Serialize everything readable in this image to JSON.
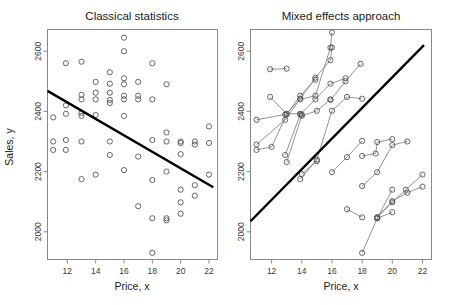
{
  "figure": {
    "width": 452,
    "height": 305,
    "background": "#ffffff",
    "panels": [
      {
        "id": "classical",
        "title": "Classical statistics"
      },
      {
        "id": "mixed",
        "title": "Mixed effects approach"
      }
    ]
  },
  "axes": {
    "xlabel": "Price, x",
    "ylabel": "Sales, y",
    "xticks": [
      12,
      14,
      16,
      18,
      20,
      22
    ],
    "yticks": [
      2000,
      2200,
      2400,
      2600
    ],
    "xlim": [
      10.6,
      22.6
    ],
    "ylim": [
      1908,
      2672
    ]
  },
  "colors": {
    "point_stroke": "#555555",
    "fit_line": "#000000",
    "group_line": "#777777",
    "frame": "#888888",
    "text": "#1a1a1a"
  },
  "chart_data": {
    "type": "scatter",
    "xlabel": "Price, x",
    "ylabel": "Sales, y",
    "xlim": [
      10.6,
      22.6
    ],
    "ylim": [
      1908,
      2672
    ],
    "grid": false,
    "legend": null,
    "panels": [
      {
        "name": "Classical statistics",
        "type": "scatter",
        "marker": "open-circle",
        "points": [
          [
            11.0,
            2380
          ],
          [
            11.0,
            2300
          ],
          [
            11.0,
            2272
          ],
          [
            11.9,
            2560
          ],
          [
            11.9,
            2420
          ],
          [
            11.9,
            2392
          ],
          [
            11.9,
            2305
          ],
          [
            11.9,
            2272
          ],
          [
            13.0,
            2565
          ],
          [
            13.0,
            2455
          ],
          [
            13.0,
            2440
          ],
          [
            13.0,
            2395
          ],
          [
            13.0,
            2385
          ],
          [
            13.0,
            2300
          ],
          [
            13.0,
            2175
          ],
          [
            14.0,
            2498
          ],
          [
            14.0,
            2462
          ],
          [
            14.0,
            2440
          ],
          [
            14.0,
            2388
          ],
          [
            14.0,
            2190
          ],
          [
            15.0,
            2530
          ],
          [
            15.0,
            2492
          ],
          [
            15.0,
            2462
          ],
          [
            15.0,
            2438
          ],
          [
            15.0,
            2428
          ],
          [
            15.0,
            2300
          ],
          [
            15.0,
            2255
          ],
          [
            16.0,
            2645
          ],
          [
            16.0,
            2600
          ],
          [
            16.0,
            2510
          ],
          [
            16.0,
            2490
          ],
          [
            16.0,
            2452
          ],
          [
            16.0,
            2440
          ],
          [
            16.0,
            2385
          ],
          [
            16.0,
            2205
          ],
          [
            17.0,
            2498
          ],
          [
            17.0,
            2452
          ],
          [
            17.0,
            2440
          ],
          [
            17.0,
            2250
          ],
          [
            17.0,
            2085
          ],
          [
            18.0,
            2560
          ],
          [
            18.0,
            2440
          ],
          [
            18.0,
            2305
          ],
          [
            18.0,
            2172
          ],
          [
            18.0,
            2045
          ],
          [
            18.0,
            1930
          ],
          [
            19.0,
            2490
          ],
          [
            19.0,
            2330
          ],
          [
            19.0,
            2300
          ],
          [
            19.0,
            2200
          ],
          [
            19.0,
            2045
          ],
          [
            19.0,
            2038
          ],
          [
            20.0,
            2300
          ],
          [
            20.0,
            2295
          ],
          [
            20.0,
            2258
          ],
          [
            20.0,
            2140
          ],
          [
            20.0,
            2098
          ],
          [
            20.0,
            2060
          ],
          [
            21.0,
            2300
          ],
          [
            21.0,
            2290
          ],
          [
            21.0,
            2155
          ],
          [
            21.0,
            2120
          ],
          [
            22.0,
            2350
          ],
          [
            22.0,
            2295
          ],
          [
            22.0,
            2190
          ]
        ],
        "fit_line": {
          "x": [
            10.6,
            22.3
          ],
          "y": [
            2468,
            2148
          ],
          "label": "pooled regression",
          "slope_sign": "negative"
        }
      },
      {
        "name": "Mixed effects approach",
        "type": "scatter-with-group-lines",
        "marker": "open-circle",
        "groups": [
          {
            "id": "g1",
            "points": [
              [
                11.9,
                2540
              ],
              [
                13.0,
                2542
              ]
            ]
          },
          {
            "id": "g2",
            "points": [
              [
                11.9,
                2448
              ],
              [
                13.0,
                2392
              ],
              [
                13.9,
                2392
              ],
              [
                14.0,
                2390
              ]
            ]
          },
          {
            "id": "g3",
            "points": [
              [
                11.0,
                2372
              ],
              [
                12.9,
                2390
              ],
              [
                13.9,
                2440
              ],
              [
                14.9,
                2452
              ],
              [
                15.9,
                2612
              ],
              [
                16.0,
                2662
              ]
            ]
          },
          {
            "id": "g4",
            "points": [
              [
                11.0,
                2290
              ],
              [
                12.9,
                2372
              ],
              [
                13.9,
                2442
              ],
              [
                14.9,
                2512
              ],
              [
                15.9,
                2570
              ],
              [
                16.0,
                2612
              ]
            ]
          },
          {
            "id": "g5",
            "points": [
              [
                11.0,
                2272
              ],
              [
                12.0,
                2282
              ],
              [
                13.0,
                2390
              ],
              [
                13.9,
                2452
              ],
              [
                14.9,
                2505
              ]
            ]
          },
          {
            "id": "g6",
            "points": [
              [
                12.9,
                2255
              ],
              [
                13.9,
                2390
              ],
              [
                14.9,
                2440
              ],
              [
                15.9,
                2492
              ],
              [
                16.9,
                2510
              ]
            ]
          },
          {
            "id": "g7",
            "points": [
              [
                13.0,
                2232
              ],
              [
                14.0,
                2385
              ],
              [
                15.0,
                2402
              ],
              [
                15.9,
                2440
              ]
            ]
          },
          {
            "id": "g8",
            "points": [
              [
                13.9,
                2175
              ],
              [
                15.0,
                2240
              ],
              [
                16.0,
                2402
              ],
              [
                17.0,
                2448
              ],
              [
                18.0,
                2442
              ]
            ]
          },
          {
            "id": "g9",
            "points": [
              [
                14.0,
                2192
              ],
              [
                15.0,
                2235
              ]
            ]
          },
          {
            "id": "g10",
            "points": [
              [
                15.9,
                2438
              ],
              [
                16.9,
                2500
              ],
              [
                17.9,
                2558
              ]
            ]
          },
          {
            "id": "g11",
            "points": [
              [
                16.0,
                2198
              ],
              [
                17.0,
                2248
              ],
              [
                18.0,
                2302
              ]
            ]
          },
          {
            "id": "g12",
            "points": [
              [
                18.0,
                2252
              ],
              [
                18.9,
                2260
              ],
              [
                19.0,
                2298
              ],
              [
                20.0,
                2308
              ]
            ]
          },
          {
            "id": "g13",
            "points": [
              [
                18.0,
                2152
              ],
              [
                19.0,
                2198
              ],
              [
                20.0,
                2288
              ],
              [
                21.0,
                2300
              ]
            ]
          },
          {
            "id": "g14",
            "points": [
              [
                17.0,
                2075
              ],
              [
                18.0,
                2048
              ]
            ]
          },
          {
            "id": "g15",
            "points": [
              [
                19.0,
                2048
              ],
              [
                20.0,
                2102
              ],
              [
                21.0,
                2130
              ],
              [
                22.0,
                2150
              ]
            ]
          },
          {
            "id": "g16",
            "points": [
              [
                19.0,
                2048
              ],
              [
                20.0,
                2098
              ],
              [
                20.9,
                2140
              ],
              [
                22.0,
                2190
              ]
            ]
          },
          {
            "id": "g17",
            "points": [
              [
                18.0,
                1930
              ],
              [
                19.0,
                2045
              ],
              [
                20.0,
                2140
              ]
            ]
          },
          {
            "id": "g18",
            "points": [
              [
                19.0,
                2045
              ],
              [
                20.0,
                2065
              ]
            ]
          }
        ],
        "fit_line": {
          "x": [
            10.6,
            22.1
          ],
          "y": [
            2035,
            2620
          ],
          "label": "mixed effects fit",
          "slope_sign": "positive"
        }
      }
    ]
  }
}
